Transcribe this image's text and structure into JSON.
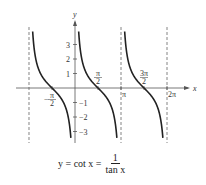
{
  "chart_data": {
    "type": "line",
    "title": "",
    "function": "cot",
    "xlabel": "x",
    "ylabel": "y",
    "xlim": [
      -3.5,
      6.8
    ],
    "ylim": [
      -3.8,
      4.2
    ],
    "x_ticks": [
      {
        "value": -1.5708,
        "label_num": "π",
        "label_den": "2",
        "sign": "−"
      },
      {
        "value": 1.5708,
        "label_num": "π",
        "label_den": "2",
        "sign": ""
      },
      {
        "value": 3.1416,
        "label": "π"
      },
      {
        "value": 4.7124,
        "label_num": "3π",
        "label_den": "2",
        "sign": ""
      },
      {
        "value": 6.2832,
        "label": "2π"
      }
    ],
    "y_ticks": [
      {
        "value": 3,
        "label": "3"
      },
      {
        "value": 2,
        "label": "2"
      },
      {
        "value": 1,
        "label": "1"
      },
      {
        "value": -1,
        "label": "−1"
      },
      {
        "value": -2,
        "label": "−2"
      },
      {
        "value": -3,
        "label": "−3"
      }
    ],
    "asymptotes": [
      -3.1416,
      3.1416,
      6.2832
    ],
    "series": [
      {
        "name": "cot x branch 1",
        "x_range": [
          -3.1416,
          0
        ]
      },
      {
        "name": "cot x branch 2",
        "x_range": [
          0,
          3.1416
        ]
      },
      {
        "name": "cot x branch 3",
        "x_range": [
          3.1416,
          6.2832
        ]
      }
    ],
    "grid": false,
    "colors": {
      "curve": "#222222",
      "axis": "#555555",
      "asymptote": "#666666"
    }
  },
  "caption": {
    "lhs": "y = cot x =",
    "numerator": "1",
    "denominator": "tan x"
  }
}
